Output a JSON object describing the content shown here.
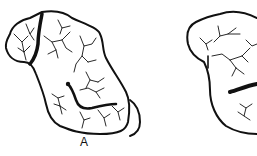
{
  "figure": {
    "panels": [
      {
        "id": "A",
        "label": "A",
        "description": "Drainage basin outline with dendritic channel network and a thick divide line"
      },
      {
        "id": "B",
        "label": "",
        "description": "Second drainage basin outline (partially cropped at right) with dendritic channels and a thick transverse band"
      }
    ],
    "colors": {
      "line": "#111111",
      "background": "#ffffff"
    }
  }
}
